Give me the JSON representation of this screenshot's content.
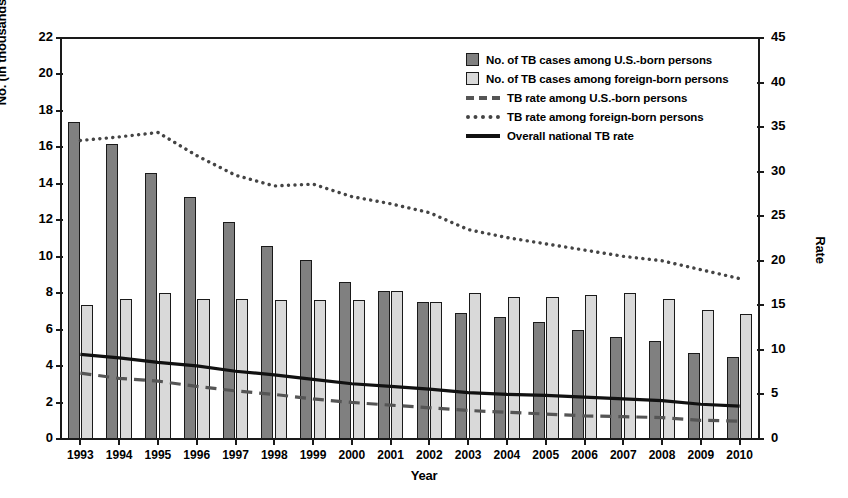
{
  "chart_data": {
    "type": "bar",
    "title": "",
    "xlabel": "Year",
    "ylabel": "No. (in thousands)",
    "ylabel_right": "Rate",
    "grid": false,
    "legend_position": "top-right",
    "ylim": [
      0,
      22
    ],
    "ylim_right": [
      0,
      45
    ],
    "ytick_labels": [
      "22",
      "20",
      "18",
      "16",
      "14",
      "12",
      "10",
      "8",
      "6",
      "4",
      "2",
      "0"
    ],
    "ytick_values": [
      22,
      20,
      18,
      16,
      14,
      12,
      10,
      8,
      6,
      4,
      2,
      0
    ],
    "ytick_right_labels": [
      "45",
      "40",
      "35",
      "30",
      "25",
      "20",
      "15",
      "10",
      "5",
      "0"
    ],
    "ytick_right_values": [
      45,
      40,
      35,
      30,
      25,
      20,
      15,
      10,
      5,
      0
    ],
    "categories": [
      "1993",
      "1994",
      "1995",
      "1996",
      "1997",
      "1998",
      "1999",
      "2000",
      "2001",
      "2002",
      "2003",
      "2004",
      "2005",
      "2006",
      "2007",
      "2008",
      "2009",
      "2010"
    ],
    "series": [
      {
        "name": "No. of TB cases among U.S.-born persons",
        "kind": "bar",
        "axis": "left",
        "color": "#808080",
        "values": [
          17.4,
          16.2,
          14.6,
          13.3,
          11.9,
          10.6,
          9.8,
          8.6,
          8.1,
          7.5,
          6.9,
          6.7,
          6.4,
          6.0,
          5.6,
          5.4,
          4.7,
          4.5
        ]
      },
      {
        "name": "No. of TB cases among foreign-born persons",
        "kind": "bar",
        "axis": "left",
        "color": "#d9d9d9",
        "values": [
          7.35,
          7.7,
          8.0,
          7.7,
          7.7,
          7.6,
          7.6,
          7.6,
          8.1,
          7.5,
          8.0,
          7.8,
          7.8,
          7.9,
          8.0,
          7.7,
          7.1,
          6.85
        ]
      },
      {
        "name": "TB rate among U.S.-born persons",
        "kind": "line",
        "style": "dashed",
        "axis": "right",
        "color": "#555555",
        "values": [
          7.4,
          6.8,
          6.5,
          5.9,
          5.4,
          5.0,
          4.5,
          4.1,
          3.8,
          3.5,
          3.2,
          3.0,
          2.8,
          2.6,
          2.5,
          2.4,
          2.1,
          2.0
        ]
      },
      {
        "name": "TB rate among foreign-born persons",
        "kind": "line",
        "style": "dotted",
        "axis": "right",
        "color": "#444444",
        "values": [
          33.5,
          33.9,
          34.4,
          31.8,
          29.6,
          28.4,
          28.6,
          27.2,
          26.4,
          25.4,
          23.5,
          22.6,
          21.9,
          21.2,
          20.5,
          20.0,
          19.0,
          18.0
        ]
      },
      {
        "name": "Overall national TB rate",
        "kind": "line",
        "style": "solid",
        "axis": "right",
        "color": "#111111",
        "values": [
          9.5,
          9.1,
          8.6,
          8.2,
          7.6,
          7.2,
          6.7,
          6.2,
          5.9,
          5.6,
          5.2,
          5.0,
          4.9,
          4.7,
          4.5,
          4.3,
          3.9,
          3.7
        ]
      }
    ]
  },
  "legend": {
    "items": [
      {
        "label": "No. of TB cases among U.S.-born persons",
        "marker": "swatch-dark"
      },
      {
        "label": "No. of TB cases among foreign-born persons",
        "marker": "swatch-light"
      },
      {
        "label": "TB rate among U.S.-born persons",
        "marker": "line-dashed"
      },
      {
        "label": "TB rate among foreign-born persons",
        "marker": "line-dotted"
      },
      {
        "label": "Overall national TB rate",
        "marker": "line-solid"
      }
    ]
  },
  "axes": {
    "x_title": "Year",
    "y_title_left": "No. (in thousands)",
    "y_title_right": "Rate"
  }
}
